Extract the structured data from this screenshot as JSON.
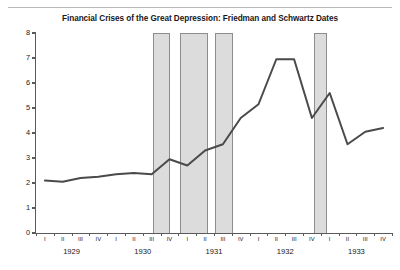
{
  "chart": {
    "title": "Financial Crises of the Great Depression: Friedman and Schwartz Dates",
    "line_color": "#4a4a4a",
    "band_color": "#dcdcdc",
    "band_border_color": "#8d8d8d",
    "axis_color": "#5a5a5a"
  },
  "chart_data": {
    "type": "line",
    "title": "Financial Crises of the Great Depression: Friedman and Schwartz Dates",
    "xlabel": "",
    "ylabel": "",
    "ylim": [
      0,
      8
    ],
    "yticks": [
      0,
      1,
      2,
      3,
      4,
      5,
      6,
      7,
      8
    ],
    "ytick_labels": [
      "0",
      "1",
      "2",
      "3",
      "4",
      "5",
      "6",
      "7",
      "8"
    ],
    "grid": false,
    "legend": null,
    "x_quarter_labels": [
      "I",
      "II",
      "III",
      "IV",
      "I",
      "II",
      "III",
      "IV",
      "I",
      "II",
      "III",
      "IV",
      "I",
      "II",
      "III",
      "IV",
      "I",
      "II",
      "III",
      "IV"
    ],
    "x_year_labels": [
      "1929",
      "1930",
      "1931",
      "1932",
      "1933"
    ],
    "x": [
      "1929-I",
      "1929-II",
      "1929-III",
      "1929-IV",
      "1930-I",
      "1930-II",
      "1930-III",
      "1930-IV",
      "1931-I",
      "1931-II",
      "1931-III",
      "1931-IV",
      "1932-I",
      "1932-II",
      "1932-III",
      "1932-IV",
      "1933-I",
      "1933-II",
      "1933-III",
      "1933-IV"
    ],
    "series": [
      {
        "name": "Interest rate spread",
        "values": [
          2.1,
          2.05,
          2.2,
          2.25,
          2.35,
          2.4,
          2.35,
          2.95,
          2.7,
          3.3,
          3.55,
          4.6,
          5.15,
          6.95,
          6.95,
          4.6,
          5.6,
          3.55,
          4.05,
          4.2
        ]
      }
    ],
    "shaded_bands": [
      {
        "label": "Crisis 1 (Oct 1930)",
        "start": "1930-IV",
        "end": "1931-I"
      },
      {
        "label": "Crisis 2 (Mar 1931)",
        "start": "1931-II",
        "end": "1931-III"
      },
      {
        "label": "Crisis 3 (Sep 1931)",
        "start": "1931-IV",
        "end": "1932-I"
      },
      {
        "label": "Crisis 4 (Mar 1933)",
        "start": "1933-I",
        "end": "1933-I"
      }
    ]
  }
}
